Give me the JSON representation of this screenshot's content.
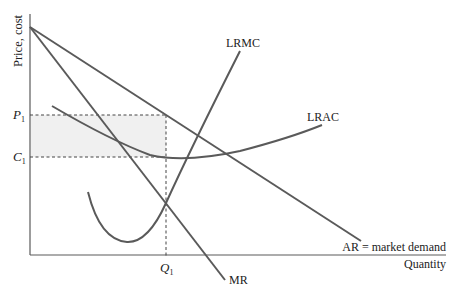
{
  "diagram": {
    "axes": {
      "y_label": "Price, cost",
      "x_label": "Quantity"
    },
    "levels": {
      "p1_label": "P",
      "p1_sub": "1",
      "c1_label": "C",
      "c1_sub": "1",
      "q1_label": "Q",
      "q1_sub": "1"
    },
    "curves": {
      "lrmc": "LRMC",
      "lrac": "LRAC",
      "ar": "AR = market demand",
      "mr": "MR"
    },
    "colors": {
      "line": "#5a5a5a",
      "profit_area": "#f0f0f0",
      "text": "#222222"
    }
  }
}
